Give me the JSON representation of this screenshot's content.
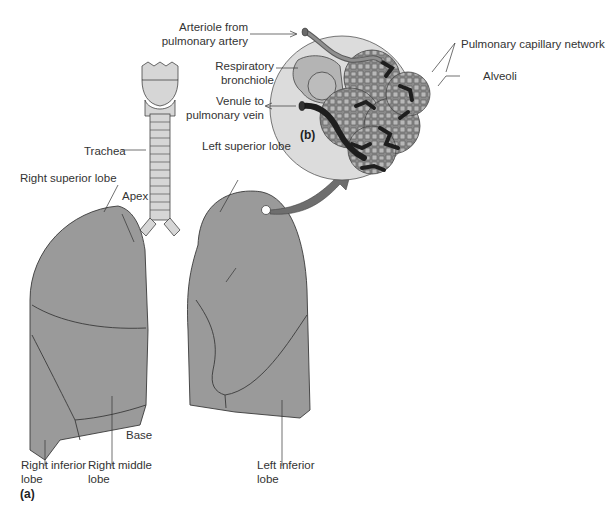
{
  "figure": {
    "panels": {
      "a": "(a)",
      "b": "(b)"
    },
    "labels_a": {
      "trachea": "Trachea",
      "right_superior_lobe": "Right superior lobe",
      "apex": "Apex",
      "left_superior_lobe": "Left superior lobe",
      "base": "Base",
      "right_inferior_lobe_1": "Right inferior",
      "right_inferior_lobe_2": "lobe",
      "right_middle_lobe_1": "Right middle",
      "right_middle_lobe_2": "lobe",
      "left_inferior_lobe_1": "Left inferior",
      "left_inferior_lobe_2": "lobe"
    },
    "labels_b": {
      "arteriole_1": "Arteriole from",
      "arteriole_2": "pulmonary artery",
      "resp_bronchiole_1": "Respiratory",
      "resp_bronchiole_2": "bronchiole",
      "venule_1": "Venule to",
      "venule_2": "pulmonary vein",
      "capillary_network": "Pulmonary capillary network",
      "alveoli": "Alveoli"
    },
    "colors": {
      "lung_fill": "#9a9a9a",
      "outline": "#3a3a3a",
      "trachea_fill": "#d6d6d6",
      "circle_fill": "#dcdcdc",
      "vein": "#1e1e1e",
      "arrow": "#6e6e6e"
    }
  }
}
